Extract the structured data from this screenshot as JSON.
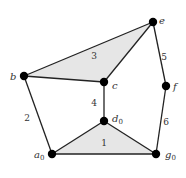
{
  "diagram": {
    "nodes": [
      {
        "id": "e",
        "label": "e",
        "sub": "",
        "x": 153,
        "y": 22,
        "lx": 159,
        "ly": 24
      },
      {
        "id": "b",
        "label": "b",
        "sub": "",
        "x": 24,
        "y": 76,
        "lx": 10,
        "ly": 80
      },
      {
        "id": "c",
        "label": "c",
        "sub": "",
        "x": 104,
        "y": 82,
        "lx": 112,
        "ly": 89
      },
      {
        "id": "f",
        "label": "f",
        "sub": "",
        "x": 166,
        "y": 86,
        "lx": 173,
        "ly": 90
      },
      {
        "id": "d0",
        "label": "d",
        "sub": "0",
        "x": 104,
        "y": 121,
        "lx": 112,
        "ly": 122
      },
      {
        "id": "a0",
        "label": "a",
        "sub": "0",
        "x": 52,
        "y": 154,
        "lx": 34,
        "ly": 158
      },
      {
        "id": "g0",
        "label": "g",
        "sub": "0",
        "x": 156,
        "y": 154,
        "lx": 165,
        "ly": 158
      }
    ],
    "edges": [
      {
        "from": "b",
        "to": "e"
      },
      {
        "from": "b",
        "to": "c"
      },
      {
        "from": "c",
        "to": "e"
      },
      {
        "from": "c",
        "to": "d0"
      },
      {
        "from": "b",
        "to": "a0"
      },
      {
        "from": "a0",
        "to": "g0"
      },
      {
        "from": "a0",
        "to": "d0"
      },
      {
        "from": "d0",
        "to": "g0"
      },
      {
        "from": "e",
        "to": "f"
      },
      {
        "from": "f",
        "to": "g0"
      }
    ],
    "faces": [
      {
        "id": "face-3",
        "points": "24,76 153,22 104,82"
      },
      {
        "id": "face-1",
        "points": "52,154 104,121 156,154"
      }
    ],
    "edge_labels": [
      {
        "text": "3",
        "x": 94,
        "y": 59
      },
      {
        "text": "5",
        "x": 164,
        "y": 60
      },
      {
        "text": "4",
        "x": 94,
        "y": 106
      },
      {
        "text": "2",
        "x": 27,
        "y": 121
      },
      {
        "text": "6",
        "x": 166,
        "y": 125
      },
      {
        "text": "1",
        "x": 104,
        "y": 146
      }
    ]
  }
}
